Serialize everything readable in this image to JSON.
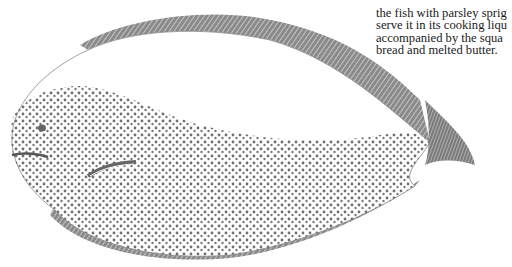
{
  "document": {
    "text_lines": [
      "",
      "the fish with parsley sprig",
      "serve it in its cooking liqu",
      "accompanied by the squa",
      "bread and melted butter."
    ]
  },
  "illustration": {
    "subject": "flatfish (sole) engraving",
    "ink_color": "#6e6e6e"
  }
}
